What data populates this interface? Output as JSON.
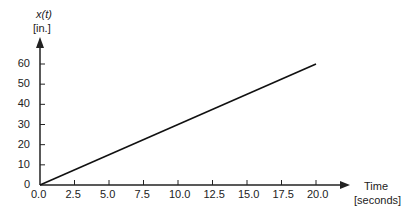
{
  "chart_data": {
    "type": "line",
    "title": "",
    "xlabel": "Time",
    "xlabel_unit": "[seconds]",
    "ylabel": "x(t)",
    "ylabel_unit": "[in.]",
    "x_ticks": [
      "0.0",
      "2.5",
      "5.0",
      "7.5",
      "10.0",
      "12.5",
      "15.0",
      "17.5",
      "20.0"
    ],
    "y_ticks": [
      "0",
      "10",
      "20",
      "30",
      "40",
      "50",
      "60"
    ],
    "xlim": [
      0,
      20
    ],
    "ylim": [
      0,
      60
    ],
    "grid": false,
    "series": [
      {
        "name": "x(t)",
        "x": [
          0,
          20
        ],
        "y": [
          0,
          60
        ],
        "color": "#111111"
      }
    ]
  },
  "colors": {
    "axis": "#222222",
    "line": "#111111"
  }
}
